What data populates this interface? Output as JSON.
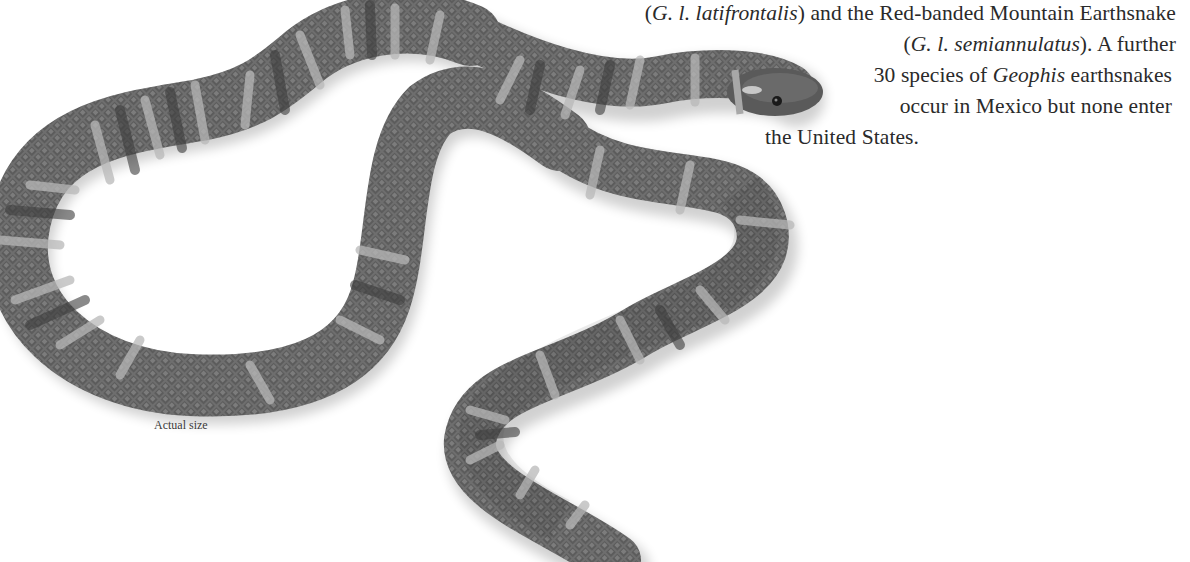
{
  "figure": {
    "caption": "Actual size",
    "colors": {
      "body_dark": "#4a4a4a",
      "body_mid": "#7a7a7a",
      "band_light": "#b5b5b5",
      "background": "#ffffff"
    }
  },
  "text": {
    "lines": [
      {
        "part1": "(",
        "italic1": "G. l. latifrontalis",
        "part2": ") and the Red-banded Mountain Earthsnake"
      },
      {
        "part1": "(",
        "italic1": "G. l. semiannulatus",
        "part2": "). A further"
      },
      {
        "part1": "30 species of ",
        "italic1": "Geophis",
        "part2": " earthsnakes"
      },
      {
        "part1": "occur in Mexico but none enter"
      },
      {
        "part1": "the United States."
      }
    ]
  }
}
